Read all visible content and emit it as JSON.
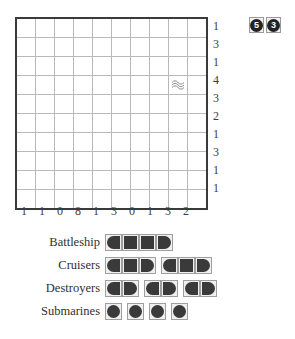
{
  "puzzle": {
    "title": "Battleships Puzzle",
    "badge": {
      "name": "puzzle-number-badge",
      "digits": [
        "5",
        "3"
      ]
    },
    "grid": {
      "rows": 10,
      "cols": 10,
      "row_clues": [
        1,
        3,
        1,
        4,
        3,
        2,
        1,
        3,
        1,
        1
      ],
      "col_clues": [
        1,
        1,
        0,
        8,
        1,
        3,
        0,
        1,
        3,
        2
      ],
      "given_marks": [
        {
          "row": 4,
          "col": 9,
          "type": "water",
          "icon": "wave-icon"
        }
      ]
    },
    "fleet": {
      "rows": [
        {
          "label": "Battleship",
          "ship_length": 4,
          "count": 1
        },
        {
          "label": "Cruisers",
          "ship_length": 3,
          "count": 2
        },
        {
          "label": "Destroyers",
          "ship_length": 2,
          "count": 3
        },
        {
          "label": "Submarines",
          "ship_length": 1,
          "count": 4
        }
      ]
    },
    "colors": {
      "ship_fill": "#3a3a3a",
      "grid_border": "#3a3a3a",
      "grid_line": "#b9b9b9",
      "cell_bg": "#f0f0f0",
      "badge_disc": "#232323",
      "page_bg": "#ffffff"
    }
  }
}
